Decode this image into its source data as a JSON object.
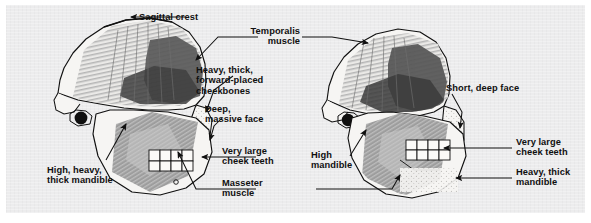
{
  "figure": {
    "kind": "comparative-anatomy-diagram",
    "background_color": "#ececed",
    "page_color": "#ffffff",
    "ink_color": "#101010",
    "muscle_light_color": "#bdbdbd",
    "muscle_mid_color": "#9a9a9a",
    "muscle_dark_color": "#4a4a4a",
    "bone_fill_color": "#f6f5f3"
  },
  "specimens": [
    {
      "id": "left-skull",
      "position": "left",
      "description": "Robust skull with sagittal crest, large temporalis and masseter muscles"
    },
    {
      "id": "right-skull",
      "position": "right",
      "description": "Skull with short deep face, high mandible and large cheek teeth"
    }
  ],
  "labels": {
    "sagittal_crest": "Sagittal crest",
    "temporalis_muscle": "Temporalis\nmuscle",
    "heavy_thick_cheekbones": "Heavy, thick,\nforward-placed\ncheekbones",
    "deep_massive_face": "Deep,\nmassive face",
    "very_large_cheek_teeth_left": "Very large\ncheek teeth",
    "masseter_muscle": "Masseter\nmuscle",
    "high_heavy_thick_mandible": "High, heavy,\nthick mandible",
    "short_deep_face": "Short, deep face",
    "very_large_cheek_teeth_right": "Very large\ncheek teeth",
    "heavy_thick_mandible": "Heavy, thick\nmandible",
    "high_mandible": "High\nmandible"
  }
}
